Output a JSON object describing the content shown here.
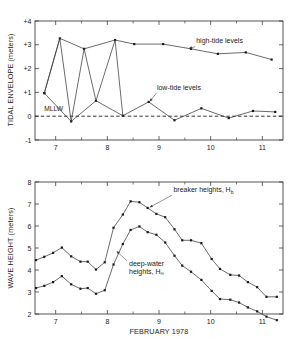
{
  "figure": {
    "background_color": "#ffffff",
    "line_color": "#3a3a3a",
    "marker_color": "#1a1a1a",
    "text_color": "#1a1a1a"
  },
  "chart_data": [
    {
      "type": "line",
      "id": "tidal-envelope",
      "title": "",
      "xlabel": "",
      "ylabel": "TIDAL ENVELOPE (meters)",
      "xlim": [
        6.6,
        11.4
      ],
      "ylim": [
        -1,
        4
      ],
      "xticks": [
        7,
        8,
        9,
        10,
        11
      ],
      "xticklabels": [
        "7",
        "8",
        "9",
        "10",
        "11"
      ],
      "xminorticks": [
        7.5,
        8.5,
        9.5,
        10.5
      ],
      "yticks": [
        -1,
        0,
        1,
        2,
        3,
        4
      ],
      "yticklabels": [
        "-1",
        "0",
        "+1",
        "+2",
        "+3",
        "+4"
      ],
      "grid": false,
      "reference_line": {
        "label": "MLLW",
        "y": 0,
        "style": "dashed"
      },
      "annotations": [
        {
          "text": "high-tide levels",
          "x": 9.72,
          "y": 3.08
        },
        {
          "text": "low-tide levels",
          "x": 8.96,
          "y": 1.12
        },
        {
          "text": "MLLW",
          "x": 6.78,
          "y": 0.22
        }
      ],
      "series": [
        {
          "name": "high-tide levels",
          "x": [
            6.78,
            7.08,
            7.55,
            8.15,
            8.52,
            9.08,
            9.62,
            10.14,
            10.68,
            11.18
          ],
          "values": [
            0.97,
            3.27,
            2.83,
            3.2,
            3.03,
            3.03,
            2.83,
            2.62,
            2.68,
            2.38
          ]
        },
        {
          "name": "low-tide levels",
          "x": [
            6.78,
            7.3,
            7.78,
            8.3,
            8.8,
            9.3,
            9.82,
            10.35,
            10.82,
            11.25
          ],
          "values": [
            0.97,
            -0.22,
            0.65,
            0.02,
            0.6,
            -0.17,
            0.33,
            -0.08,
            0.22,
            0.18
          ]
        },
        {
          "name": "envelope-connector",
          "x": [
            6.78,
            7.08,
            7.3,
            7.55,
            7.78,
            8.15,
            8.3
          ],
          "values": [
            0.97,
            3.27,
            -0.22,
            2.83,
            0.65,
            3.2,
            0.02
          ]
        }
      ]
    },
    {
      "type": "line",
      "id": "wave-height",
      "title": "",
      "xlabel": "FEBRUARY 1978",
      "ylabel": "WAVE HEIGHT (meters)",
      "xlim": [
        6.6,
        11.4
      ],
      "ylim": [
        2,
        8
      ],
      "xticks": [
        7,
        8,
        9,
        10,
        11
      ],
      "xticklabels": [
        "7",
        "8",
        "9",
        "10",
        "11"
      ],
      "xminorticks": [
        7.5,
        8.5,
        9.5,
        10.5
      ],
      "yticks": [
        2,
        3,
        4,
        5,
        6,
        7,
        8
      ],
      "yticklabels": [
        "2",
        "3",
        "4",
        "5",
        "6",
        "7",
        "8"
      ],
      "grid": false,
      "annotations": [
        {
          "text": "breaker heights, H",
          "subscript": "b",
          "x": 9.28,
          "y": 7.55
        },
        {
          "text": "deep-water",
          "line2": "heights, H",
          "subscript": "∞",
          "x": 8.42,
          "y": 4.2
        }
      ],
      "series": [
        {
          "name": "breaker heights, Hb",
          "x": [
            6.62,
            6.78,
            6.95,
            7.12,
            7.3,
            7.48,
            7.62,
            7.78,
            7.95,
            8.12,
            8.3,
            8.45,
            8.62,
            8.78,
            8.95,
            9.12,
            9.3,
            9.45,
            9.62,
            9.82,
            10.02,
            10.18,
            10.38,
            10.55,
            10.72,
            10.9,
            11.08,
            11.28
          ],
          "values": [
            4.45,
            4.6,
            4.78,
            5.02,
            4.62,
            4.38,
            4.38,
            4.02,
            4.35,
            5.92,
            6.52,
            7.12,
            7.08,
            6.82,
            6.55,
            6.4,
            5.85,
            5.35,
            5.35,
            5.22,
            4.5,
            4.05,
            3.78,
            3.75,
            3.45,
            3.22,
            2.78,
            2.78
          ]
        },
        {
          "name": "deep-water heights, Hinf",
          "x": [
            6.62,
            6.78,
            6.95,
            7.12,
            7.3,
            7.48,
            7.62,
            7.78,
            7.95,
            8.12,
            8.3,
            8.45,
            8.62,
            8.78,
            8.95,
            9.12,
            9.3,
            9.45,
            9.62,
            9.82,
            10.02,
            10.18,
            10.38,
            10.55,
            10.72,
            10.9,
            11.08,
            11.28
          ],
          "values": [
            3.18,
            3.28,
            3.45,
            3.72,
            3.35,
            3.15,
            3.18,
            2.92,
            3.08,
            4.25,
            5.18,
            5.82,
            5.98,
            5.72,
            5.6,
            5.25,
            4.65,
            4.2,
            3.92,
            3.55,
            3.05,
            2.68,
            2.65,
            2.52,
            2.3,
            2.12,
            1.88,
            1.72
          ]
        }
      ]
    }
  ]
}
